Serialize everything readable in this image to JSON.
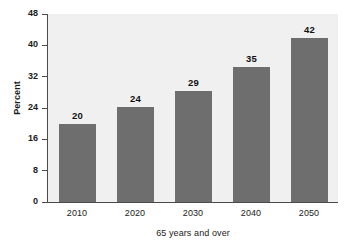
{
  "chart_data": {
    "type": "bar",
    "title": "",
    "subtitle": "",
    "xlabel": "65 years and over",
    "ylabel": "Percent",
    "categories": [
      "2010",
      "2020",
      "2030",
      "2040",
      "2050"
    ],
    "values": [
      20,
      24,
      29,
      35,
      42
    ],
    "bar_tops_actual": [
      20.0,
      24.2,
      28.3,
      34.5,
      42.0
    ],
    "data_labels": [
      "20",
      "24",
      "29",
      "35",
      "42"
    ],
    "ylim": [
      0,
      48
    ],
    "yticks": [
      0,
      8,
      16,
      24,
      32,
      40,
      48
    ],
    "ytick_labels": [
      "0",
      "8",
      "16",
      "24",
      "32",
      "40",
      "48"
    ],
    "xtick_labels": [
      "2010",
      "2020",
      "2030",
      "2040",
      "2050"
    ],
    "grid": false,
    "legend": false,
    "legend_position": "none",
    "series": [
      {
        "name": "Percent 65 years and over",
        "values": [
          20,
          24,
          29,
          35,
          42
        ]
      }
    ],
    "colors": {
      "bar": "#6e6e6e",
      "plot_background": "#f0f0f0",
      "page_background": "#ffffff",
      "axis": "#4a4a4a",
      "text": "#1b1b1b",
      "data_label": "#111111"
    }
  }
}
